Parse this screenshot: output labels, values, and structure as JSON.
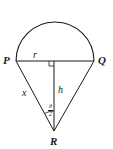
{
  "diagram": {
    "type": "geometry",
    "points": {
      "P": "P",
      "Q": "Q",
      "R": "R"
    },
    "labels": {
      "radius": "r",
      "height": "h",
      "side": "x",
      "angle_numerator": "θ",
      "angle_denominator": "2"
    },
    "colors": {
      "stroke": "#1a1a1a",
      "background": "#ffffff"
    }
  }
}
